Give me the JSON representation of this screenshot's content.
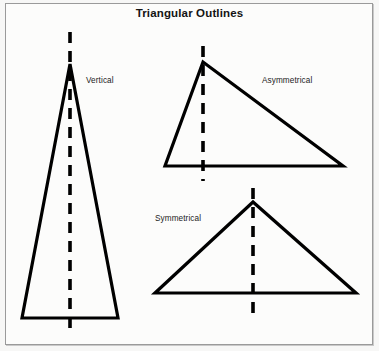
{
  "figure": {
    "title": "Triangular Outlines",
    "background_color": "#f7f7f6",
    "frame_color": "#9a9a9a",
    "ink_color": "#000000"
  },
  "shapes": [
    {
      "id": "vertical",
      "label": "Vertical",
      "kind": "triangle-outline",
      "description": "tall narrow isosceles triangle with vertical dashed axis",
      "apex": {
        "x": 70,
        "y": 64
      },
      "base_left": {
        "x": 22,
        "y": 318
      },
      "base_right": {
        "x": 118,
        "y": 318
      },
      "axis": {
        "x": 70,
        "y_top": 32,
        "y_bottom": 334
      },
      "label_pos": {
        "x": 86,
        "y": 76
      }
    },
    {
      "id": "asymmetrical",
      "label": "Asymmetrical",
      "kind": "triangle-outline",
      "description": "scalene triangle, apex near left, long sloping right side",
      "apex": {
        "x": 203,
        "y": 62
      },
      "base_left": {
        "x": 165,
        "y": 166
      },
      "base_right": {
        "x": 343,
        "y": 166
      },
      "axis": {
        "x": 203,
        "y_top": 46,
        "y_bottom": 181
      },
      "label_pos": {
        "x": 262,
        "y": 76
      }
    },
    {
      "id": "symmetrical",
      "label": "Symmetrical",
      "kind": "triangle-outline",
      "description": "wide low isosceles triangle with vertical dashed axis",
      "apex": {
        "x": 253,
        "y": 202
      },
      "base_left": {
        "x": 155,
        "y": 293
      },
      "base_right": {
        "x": 356,
        "y": 293
      },
      "axis": {
        "x": 253,
        "y_top": 188,
        "y_bottom": 321
      },
      "label_pos": {
        "x": 155,
        "y": 214
      }
    }
  ]
}
